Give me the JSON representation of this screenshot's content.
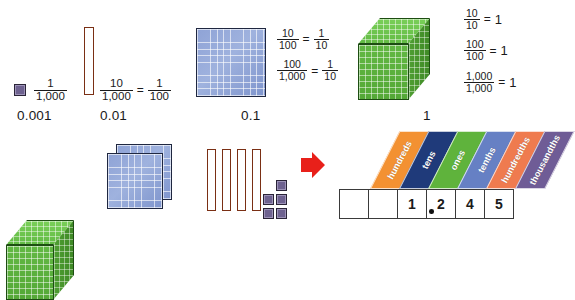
{
  "top_row": {
    "items": [
      {
        "key": "thousandth",
        "block": "unit-cube",
        "fraction": {
          "numerator": "1",
          "denominator": "1,000"
        },
        "decimal": "0.001"
      },
      {
        "key": "hundredth",
        "block": "rod",
        "fraction": {
          "numerator": "10",
          "denominator": "1,000"
        },
        "equals": "=",
        "fraction2": {
          "numerator": "1",
          "denominator": "100"
        },
        "decimal": "0.01"
      },
      {
        "key": "tenth",
        "block": "flat",
        "equations": [
          {
            "numerator": "10",
            "denominator": "100",
            "equals": "=",
            "numerator2": "1",
            "denominator2": "10"
          },
          {
            "numerator": "100",
            "denominator": "1,000",
            "equals": "=",
            "numerator2": "1",
            "denominator2": "10"
          }
        ],
        "decimal": "0.1"
      },
      {
        "key": "one",
        "block": "cube",
        "equations": [
          {
            "numerator": "10",
            "denominator": "10",
            "equals": "=",
            "result": "1"
          },
          {
            "numerator": "100",
            "denominator": "100",
            "equals": "=",
            "result": "1"
          },
          {
            "numerator": "1,000",
            "denominator": "1,000",
            "equals": "=",
            "result": "1"
          }
        ],
        "decimal": "1"
      }
    ]
  },
  "bottom_row": {
    "model": {
      "cubes": 1,
      "flats": 2,
      "rods": 4,
      "units": 5,
      "arrow": "right-arrow"
    }
  },
  "place_value_chart": {
    "columns": [
      {
        "label": "hundreds",
        "digit": "",
        "color": "#f39132"
      },
      {
        "label": "tens",
        "digit": "",
        "color": "#1f3a7a"
      },
      {
        "label": "ones",
        "digit": "1",
        "color": "#5fb33c"
      },
      {
        "label": "tenths",
        "digit": "2",
        "color": "#6680c4"
      },
      {
        "label": "hundredths",
        "digit": "4",
        "color": "#ef7b4f"
      },
      {
        "label": "thousandths",
        "digit": "5",
        "color": "#6f5c96"
      }
    ],
    "decimal_point": "."
  },
  "colors": {
    "unit_cube": "#6e6290",
    "rod": "#ef8f70",
    "flat": "#8fa3d6",
    "cube": "#5fb33c",
    "arrow": "#e8201a"
  }
}
